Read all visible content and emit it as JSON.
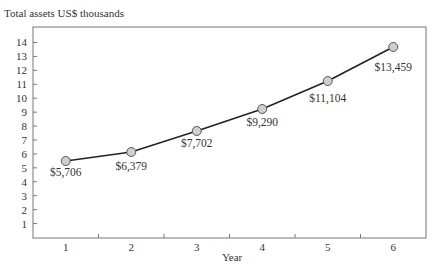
{
  "chart_data": {
    "type": "line",
    "title": "Total assets US$ thousands",
    "xlabel": "Year",
    "ylabel": "",
    "categories": [
      "1",
      "2",
      "3",
      "4",
      "5",
      "6"
    ],
    "series": [
      {
        "name": "Total assets",
        "values": [
          5.706,
          6.379,
          7.702,
          9.29,
          11.104,
          13.459
        ],
        "labels": [
          "$5,706",
          "$6,379",
          "$7,702",
          "$9,290",
          "$11,104",
          "$13,459"
        ]
      }
    ],
    "yticks": [
      1,
      2,
      3,
      4,
      5,
      6,
      7,
      8,
      9,
      10,
      11,
      12,
      13,
      14
    ],
    "ylim": [
      0,
      14.5
    ],
    "grid": false,
    "legend": "none",
    "colors": {
      "line": "#222222",
      "marker_fill": "#cfcfcf",
      "marker_stroke": "#555555",
      "frame": "#777777",
      "text": "#333333"
    }
  }
}
